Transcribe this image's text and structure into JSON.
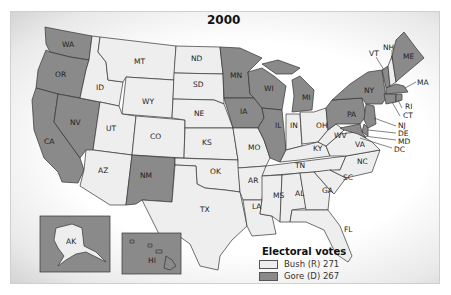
{
  "title": "2000",
  "colors": {
    "bush": "#eeeeee",
    "gore": "#8a8a8a",
    "border": "#333333",
    "background": "#ffffff"
  },
  "legend": {
    "title": "Electoral votes",
    "items": [
      {
        "label": "Bush (R) 271",
        "party": "R",
        "candidate": "Bush",
        "votes": 271,
        "color": "#eeeeee"
      },
      {
        "label": "Gore (D) 267",
        "party": "D",
        "candidate": "Gore",
        "votes": 267,
        "color": "#8a8a8a"
      }
    ]
  },
  "states": {
    "gore": [
      "WA",
      "OR",
      "CA",
      "NV",
      "NM",
      "MN",
      "IA",
      "WI",
      "IL",
      "MI",
      "PA",
      "NY",
      "VT",
      "ME",
      "MA",
      "RI",
      "CT",
      "NJ",
      "DE",
      "MD",
      "DC",
      "HI"
    ],
    "bush": [
      "ID",
      "MT",
      "WY",
      "UT",
      "AZ",
      "CO",
      "ND",
      "SD",
      "NE",
      "KS",
      "OK",
      "TX",
      "MO",
      "AR",
      "LA",
      "MS",
      "AL",
      "TN",
      "KY",
      "IN",
      "OH",
      "WV",
      "VA",
      "NC",
      "SC",
      "GA",
      "FL",
      "NH",
      "AK"
    ]
  },
  "labels": {
    "WA": "WA",
    "OR": "OR",
    "CA": "CA",
    "NV": "NV",
    "ID": "ID",
    "MT": "MT",
    "WY": "WY",
    "UT": "UT",
    "AZ": "AZ",
    "CO": "CO",
    "NM": "NM",
    "ND": "ND",
    "SD": "SD",
    "NE": "NE",
    "KS": "KS",
    "OK": "OK",
    "TX": "TX",
    "MN": "MN",
    "IA": "IA",
    "MO": "MO",
    "AR": "AR",
    "LA": "LA",
    "WI": "WI",
    "IL": "IL",
    "MI": "MI",
    "IN": "IN",
    "OH": "OH",
    "KY": "KY",
    "TN": "TN",
    "MS": "MS",
    "AL": "AL",
    "GA": "GA",
    "FL": "FL",
    "SC": "SC",
    "NC": "NC",
    "VA": "VA",
    "WV": "WV",
    "PA": "PA",
    "NY": "NY",
    "VT": "VT",
    "NH": "NH",
    "ME": "ME",
    "MA": "MA",
    "RI": "RI",
    "CT": "CT",
    "NJ": "NJ",
    "DE": "DE",
    "MD": "MD",
    "DC": "DC",
    "AK": "AK",
    "HI": "HI"
  }
}
